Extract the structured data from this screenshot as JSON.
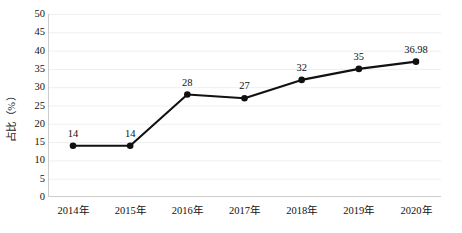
{
  "chart_data": {
    "type": "line",
    "title": "",
    "subtitle": "",
    "xlabel": "",
    "ylabel": "占比（%）",
    "categories": [
      "2014年",
      "2015年",
      "2016年",
      "2017年",
      "2018年",
      "2019年",
      "2020年"
    ],
    "values": [
      14,
      14,
      28,
      27,
      32,
      35,
      36.98
    ],
    "point_labels": [
      "14",
      "14",
      "28",
      "27",
      "32",
      "35",
      "36.98"
    ],
    "series": [
      {
        "name": "占比",
        "values": [
          14,
          14,
          28,
          27,
          32,
          35,
          36.98
        ]
      }
    ],
    "ylim": [
      0,
      50
    ],
    "y_ticks": [
      0,
      5,
      10,
      15,
      20,
      25,
      30,
      35,
      40,
      45,
      50
    ],
    "y_tick_labels": [
      "0",
      "5",
      "10",
      "15",
      "20",
      "25",
      "30",
      "35",
      "40",
      "45",
      "50"
    ],
    "grid": true,
    "grid_axis": "y",
    "legend": false,
    "legend_position": "none",
    "marker": "circle",
    "colors": {
      "line": "#111111",
      "marker": "#111111",
      "grid": "#efefef",
      "axis": "#cccccc",
      "text": "#111111",
      "background": "#ffffff"
    }
  }
}
